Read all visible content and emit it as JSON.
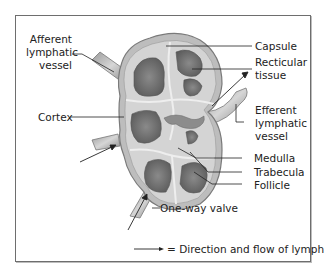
{
  "diagram": {
    "labels": {
      "afferent": [
        "Afferent",
        "lymphatic",
        "vessel"
      ],
      "cortex": "Cortex",
      "capsule": "Capsule",
      "reticular": [
        "Recticular",
        "tissue"
      ],
      "efferent": [
        "Efferent",
        "lymphatic",
        "vessel"
      ],
      "medulla": "Medulla",
      "trabecula": "Trabecula",
      "follicle": "Follicle",
      "valve": "One-way valve"
    },
    "legend": {
      "text": "= Direction and flow of lymph",
      "symbol": "arrow"
    },
    "colors": {
      "frame": "#6e6e6e",
      "tissue_light": "#c8c8c8",
      "tissue_mid": "#a9a9a9",
      "follicle_dark": "#6f6f6f",
      "leader_line": "#222222"
    }
  }
}
